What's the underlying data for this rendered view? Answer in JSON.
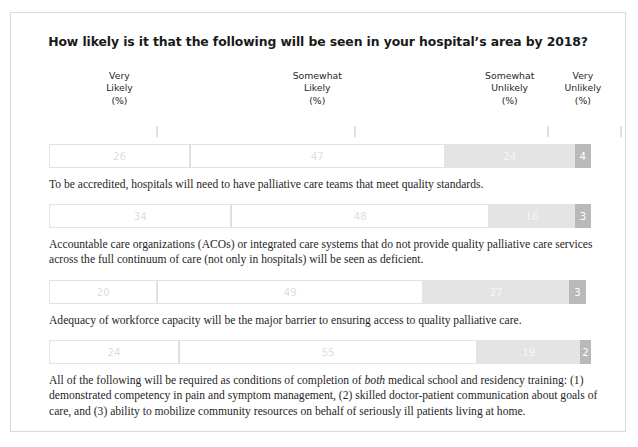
{
  "chart_data": {
    "type": "bar",
    "subtype": "stacked-horizontal-100pct",
    "title": "How likely is it that the following will be seen in your hospital’s area by 2018?",
    "xlabel": "",
    "ylabel": "",
    "xlim": [
      0,
      100
    ],
    "grid": false,
    "legend_position": "top",
    "units": "%",
    "categories": [
      "To be accredited, hospitals will need to have palliative care teams that meet quality standards.",
      "Accountable care organizations (ACOs) or integrated care systems that do not provide quality palliative care services across the full continuum of care (not only in hospitals) will be seen as deficient.",
      "Adequacy of workforce capacity will be the major barrier to ensuring access to quality palliative care.",
      "All of the following will be required as conditions of completion of both medical school and residency training: (1) demonstrated competency in pain and symptom management, (2) skilled doctor-patient communication about goals of care, and (3) ability to mobilize community resources on behalf of seriously ill patients living at home."
    ],
    "series": [
      {
        "name": "Very Likely (%)",
        "values": [
          26,
          34,
          20,
          24
        ]
      },
      {
        "name": "Somewhat Likely (%)",
        "values": [
          47,
          48,
          49,
          55
        ]
      },
      {
        "name": "Somewhat Unlikely (%)",
        "values": [
          24,
          16,
          27,
          19
        ]
      },
      {
        "name": "Very Unlikely (%)",
        "values": [
          3,
          3,
          3,
          2
        ]
      }
    ],
    "colors": {
      "very_likely": "#ffffff",
      "somewhat_likely": "#ffffff",
      "somewhat_unlikely": "#e4e4e4",
      "very_unlikely": "#b9b9b9",
      "border": "#e3e3e3",
      "frame": "#d9d9d9",
      "title_text": "#1a1a1a",
      "body_text": "#262626"
    }
  },
  "headers": [
    {
      "line1": "Very",
      "line2": "Likely",
      "line3": "(%)",
      "center_pct": 13.0
    },
    {
      "line1": "Somewhat",
      "line2": "Likely",
      "line3": "(%)",
      "center_pct": 49.5
    },
    {
      "line1": "Somewhat",
      "line2": "Unlikely",
      "line3": "(%)",
      "center_pct": 85.0
    },
    {
      "line1": "Very",
      "line2": "Unlikely",
      "line3": "(%)",
      "center_pct": 98.5
    }
  ],
  "rows": [
    {
      "values": {
        "very_likely": "26",
        "somewhat_likely": "47",
        "somewhat_unlikely": "24",
        "very_unlikely": "4"
      },
      "statement_pre": "To be accredited, hospitals will need to have palliative care teams that meet quality standards.",
      "statement_em": "",
      "statement_post": ""
    },
    {
      "values": {
        "very_likely": "34",
        "somewhat_likely": "48",
        "somewhat_unlikely": "16",
        "very_unlikely": "3"
      },
      "statement_pre": "Accountable care organizations (ACOs) or integrated care systems that do not provide quality palliative care services across the full continuum of care (not only in hospitals) will be seen as deficient.",
      "statement_em": "",
      "statement_post": ""
    },
    {
      "values": {
        "very_likely": "20",
        "somewhat_likely": "49",
        "somewhat_unlikely": "27",
        "very_unlikely": "3"
      },
      "statement_pre": "Adequacy of workforce capacity will be the major barrier to ensuring access to quality palliative care.",
      "statement_em": "",
      "statement_post": ""
    },
    {
      "values": {
        "very_likely": "24",
        "somewhat_likely": "55",
        "somewhat_unlikely": "19",
        "very_unlikely": "2"
      },
      "statement_pre": "All of the following will be required as conditions of completion of ",
      "statement_em": "both",
      "statement_post": " medical school and residency training: (1) demonstrated competency in pain and symptom management, (2) skilled doctor-patient communication about goals of care, and (3) ability to mobilize community resources on behalf of seriously ill patients living at home."
    }
  ]
}
